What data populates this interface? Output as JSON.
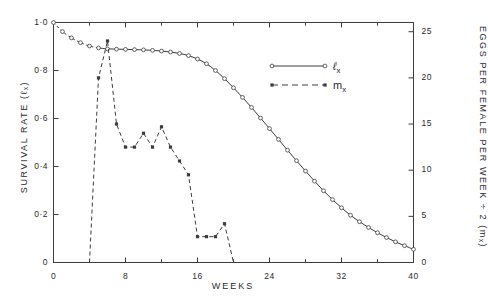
{
  "chart_data": {
    "type": "line",
    "title": "",
    "xlabel": "WEEKS",
    "ylabel": "SURVIVAL  RATE  (ℓₓ)",
    "y2label": "EGGS  PER  FEMALE  PER  WEEK  ÷  2   (mₓ)",
    "xlim": [
      0,
      40
    ],
    "ylim": [
      0,
      1.0
    ],
    "y2lim": [
      0,
      26
    ],
    "grid": false,
    "legend_position": "upper-right-inside",
    "x_ticks": [
      0,
      8,
      16,
      24,
      32,
      40
    ],
    "x_tick_labels": [
      "0",
      "8",
      "16",
      "24",
      "32",
      "40"
    ],
    "x_minor_ticks": [
      4,
      12,
      20,
      28,
      36
    ],
    "y_ticks": [
      0,
      0.2,
      0.4,
      0.6,
      0.8,
      1.0
    ],
    "y_tick_labels": [
      "0",
      "0·2",
      "0·4",
      "0·6",
      "0·8",
      "1·0"
    ],
    "y2_ticks": [
      0,
      5,
      10,
      15,
      20,
      25
    ],
    "y2_tick_labels": [
      "0",
      "5",
      "10",
      "15",
      "20",
      "25"
    ],
    "series": [
      {
        "name": "ℓₓ",
        "legend_label": "ℓx",
        "axis": "left",
        "style": "solid",
        "marker": "open-circle",
        "color": "#3c3c3c",
        "x": [
          0,
          1,
          2,
          3,
          4,
          5,
          6,
          7,
          8,
          9,
          10,
          11,
          12,
          13,
          14,
          15,
          16,
          17,
          18,
          19,
          20,
          21,
          22,
          23,
          24,
          25,
          26,
          27,
          28,
          29,
          30,
          31,
          32,
          33,
          34,
          35,
          36,
          37,
          38,
          39,
          40
        ],
        "y": [
          1.0,
          0.962,
          0.936,
          0.916,
          0.902,
          0.894,
          0.89,
          0.889,
          0.888,
          0.887,
          0.886,
          0.884,
          0.881,
          0.877,
          0.871,
          0.862,
          0.848,
          0.828,
          0.8,
          0.766,
          0.728,
          0.688,
          0.646,
          0.602,
          0.558,
          0.513,
          0.468,
          0.424,
          0.381,
          0.339,
          0.299,
          0.262,
          0.228,
          0.197,
          0.17,
          0.146,
          0.124,
          0.104,
          0.086,
          0.07,
          0.055
        ],
        "dashed_before_x": 5
      },
      {
        "name": "mₓ",
        "legend_label": "mx",
        "axis": "right",
        "style": "dashed",
        "marker": "filled-square",
        "color": "#3c3c3c",
        "x": [
          4,
          5,
          6,
          7,
          8,
          9,
          10,
          11,
          12,
          13,
          14,
          15,
          16,
          17,
          18,
          19,
          20
        ],
        "y": [
          0.0,
          20.0,
          24.0,
          15.0,
          12.5,
          12.5,
          14.0,
          12.5,
          14.7,
          12.5,
          11.0,
          9.5,
          2.8,
          2.8,
          2.8,
          4.2,
          0.0
        ]
      }
    ]
  },
  "legend": {
    "items": [
      {
        "label": "ℓ",
        "sub": "x",
        "style": "solid"
      },
      {
        "label": "m",
        "sub": "x",
        "style": "dashed"
      }
    ]
  }
}
